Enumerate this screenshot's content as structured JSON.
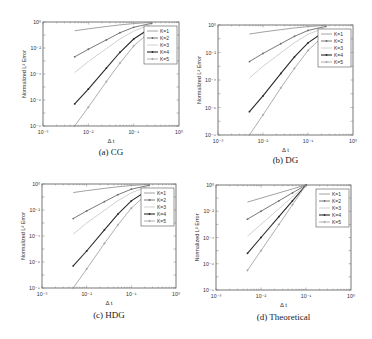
{
  "figure": {
    "shared": {
      "xlabel": "Δ t",
      "ylabel": "Normalized L² Error",
      "x_ticks": [
        "10⁻³",
        "10⁻²",
        "10⁻¹",
        "10⁰"
      ],
      "y_ticks": [
        "10⁰",
        "10⁻²",
        "10⁻⁴",
        "10⁻⁶",
        "10⁻⁸"
      ],
      "xlim_log10": [
        -3,
        0
      ],
      "ylim_log10": [
        -8,
        0
      ],
      "legend": [
        "K=1",
        "K=2",
        "K=3",
        "K=4",
        "K=5"
      ],
      "series_styles": [
        {
          "name": "K=1",
          "color": "#8a8a8a",
          "width": 0.8,
          "marker": "none"
        },
        {
          "name": "K=2",
          "color": "#6a6a6a",
          "width": 0.9,
          "marker": "dot"
        },
        {
          "name": "K=3",
          "color": "#c4c4c4",
          "width": 0.8,
          "marker": "none"
        },
        {
          "name": "K=4",
          "color": "#2a2a2a",
          "width": 1.1,
          "marker": "dot"
        },
        {
          "name": "K=5",
          "color": "#9a9a9a",
          "width": 0.8,
          "marker": "plus"
        }
      ]
    },
    "panels": [
      {
        "id": "a",
        "caption": "(a) CG",
        "box": {
          "x0": 43,
          "y0": 22,
          "x1": 179,
          "y1": 126
        },
        "caption_y": 155
      },
      {
        "id": "b",
        "caption": "(b) DG",
        "box": {
          "x0": 218,
          "y0": 25,
          "x1": 353,
          "y1": 135
        },
        "caption_y": 163
      },
      {
        "id": "c",
        "caption": "(c) HDG",
        "box": {
          "x0": 42,
          "y0": 184,
          "x1": 176,
          "y1": 288
        },
        "caption_y": 318
      },
      {
        "id": "d",
        "caption": "(d) Theoretical",
        "box": {
          "x0": 216,
          "y0": 185,
          "x1": 351,
          "y1": 290
        },
        "caption_y": 320
      }
    ]
  },
  "chart_data": [
    {
      "type": "line",
      "title": "(a) CG",
      "xlabel": "Δ t",
      "ylabel": "Normalized L² Error",
      "xscale": "log",
      "yscale": "log",
      "xlim": [
        0.001,
        1
      ],
      "ylim": [
        1e-08,
        1
      ],
      "grid": false,
      "legend_position": "upper right",
      "x": [
        0.005,
        0.01,
        0.025,
        0.05,
        0.1,
        0.25
      ],
      "series": [
        {
          "name": "K=1",
          "values": [
            0.21,
            0.3,
            0.45,
            0.6,
            0.75,
            0.95
          ]
        },
        {
          "name": "K=2",
          "values": [
            0.0021,
            0.008,
            0.042,
            0.15,
            0.39,
            0.8
          ]
        },
        {
          "name": "K=3",
          "values": [
            0.00013,
            0.0009,
            0.009,
            0.05,
            0.2,
            0.7
          ]
        },
        {
          "name": "K=4",
          "values": [
            5e-07,
            7e-06,
            0.00028,
            0.0047,
            0.049,
            0.39
          ]
        },
        {
          "name": "K=5",
          "values": [
            1e-08,
            2.8e-07,
            2.6e-05,
            0.0007,
            0.014,
            0.24
          ]
        }
      ]
    },
    {
      "type": "line",
      "title": "(b) DG",
      "xlabel": "Δ t",
      "ylabel": "Normalized L² Error",
      "xscale": "log",
      "yscale": "log",
      "xlim": [
        0.001,
        1
      ],
      "ylim": [
        1e-08,
        1
      ],
      "grid": false,
      "legend_position": "upper right",
      "x": [
        0.005,
        0.01,
        0.025,
        0.05,
        0.1,
        0.25
      ],
      "series": [
        {
          "name": "K=1",
          "values": [
            0.22,
            0.31,
            0.46,
            0.61,
            0.76,
            0.95
          ]
        },
        {
          "name": "K=2",
          "values": [
            0.0022,
            0.0085,
            0.044,
            0.15,
            0.4,
            0.8
          ]
        },
        {
          "name": "K=3",
          "values": [
            0.00014,
            0.001,
            0.0095,
            0.052,
            0.21,
            0.7
          ]
        },
        {
          "name": "K=4",
          "values": [
            5e-07,
            7e-06,
            0.0003,
            0.0048,
            0.05,
            0.4
          ]
        },
        {
          "name": "K=5",
          "values": [
            1e-08,
            2.9e-07,
            2.7e-05,
            0.0007,
            0.014,
            0.24
          ]
        }
      ]
    },
    {
      "type": "line",
      "title": "(c) HDG",
      "xlabel": "Δ t",
      "ylabel": "Normalized L² Error",
      "xscale": "log",
      "yscale": "log",
      "xlim": [
        0.001,
        1
      ],
      "ylim": [
        1e-08,
        1
      ],
      "grid": false,
      "legend_position": "upper right",
      "x": [
        0.005,
        0.01,
        0.025,
        0.05,
        0.1,
        0.25
      ],
      "series": [
        {
          "name": "K=1",
          "values": [
            0.22,
            0.31,
            0.46,
            0.61,
            0.76,
            0.95
          ]
        },
        {
          "name": "K=2",
          "values": [
            0.0022,
            0.0085,
            0.044,
            0.15,
            0.4,
            0.8
          ]
        },
        {
          "name": "K=3",
          "values": [
            0.00014,
            0.001,
            0.0095,
            0.052,
            0.21,
            0.7
          ]
        },
        {
          "name": "K=4",
          "values": [
            5e-07,
            7e-06,
            0.0003,
            0.0048,
            0.05,
            0.4
          ]
        },
        {
          "name": "K=5",
          "values": [
            1e-08,
            2.9e-07,
            2.7e-05,
            0.0007,
            0.014,
            0.24
          ]
        }
      ]
    },
    {
      "type": "line",
      "title": "(d) Theoretical",
      "xlabel": "Δ t",
      "ylabel": "Normalized L² Error",
      "xscale": "log",
      "yscale": "log",
      "xlim": [
        0.001,
        1
      ],
      "ylim": [
        1e-08,
        1
      ],
      "grid": false,
      "legend_position": "upper right",
      "x": [
        0.005,
        0.01,
        0.025,
        0.05,
        0.1
      ],
      "series": [
        {
          "name": "K=1",
          "values": [
            0.05,
            0.1,
            0.25,
            0.5,
            1
          ]
        },
        {
          "name": "K=2",
          "values": [
            0.0025,
            0.01,
            0.0625,
            0.25,
            1
          ]
        },
        {
          "name": "K=3",
          "values": [
            0.000125,
            0.001,
            0.015625,
            0.125,
            1
          ]
        },
        {
          "name": "K=4",
          "values": [
            6.25e-06,
            0.0001,
            0.00390625,
            0.0625,
            1
          ]
        },
        {
          "name": "K=5",
          "values": [
            3.125e-07,
            1e-05,
            0.0009765625,
            0.03125,
            1
          ]
        }
      ]
    }
  ]
}
